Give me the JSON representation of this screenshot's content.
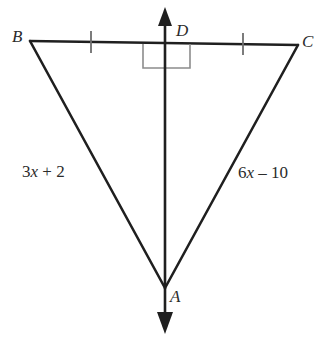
{
  "figure": {
    "type": "geometry-diagram",
    "background_color": "#ffffff",
    "stroke_color": "#1f1f1f",
    "accent_color": "#8c8c8c",
    "width": 325,
    "height": 342
  },
  "vertices": {
    "B": {
      "label": "B",
      "x": 30,
      "y": 41
    },
    "C": {
      "label": "C",
      "x": 298,
      "y": 45
    },
    "D": {
      "label": "D",
      "x": 165,
      "y": 43
    },
    "A": {
      "label": "A",
      "x": 165,
      "y": 287
    }
  },
  "segments": {
    "left_side": {
      "label": "3x + 2",
      "coefficient": "3",
      "variable": "x",
      "operator": "+",
      "constant": "2",
      "from": "B",
      "to": "A"
    },
    "right_side": {
      "label": "6x – 10",
      "coefficient": "6",
      "variable": "x",
      "operator": "–",
      "constant": "10",
      "from": "C",
      "to": "A"
    },
    "base": {
      "from": "B",
      "to": "C"
    }
  },
  "marks": {
    "congruent_ticks": [
      {
        "name": "tick-left",
        "x": 91,
        "y": 42
      },
      {
        "name": "tick-right",
        "x": 243,
        "y": 44
      }
    ],
    "right_angle": {
      "name": "right-angle-square",
      "x": 143,
      "y": 45,
      "size": 23,
      "color": "#8c8c8c"
    }
  },
  "line_AD": {
    "name": "perpendicular-bisector",
    "top_arrow_tip_y": 8,
    "bottom_arrow_tip_y": 333,
    "x": 165,
    "double_headed": true
  }
}
